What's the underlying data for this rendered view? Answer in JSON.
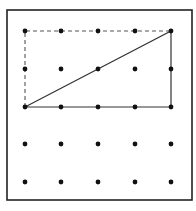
{
  "diagram": {
    "type": "geoboard",
    "grid": {
      "rows": 5,
      "cols": 5
    },
    "frame": {
      "x": 7,
      "y": 10,
      "width": 185,
      "height": 190,
      "stroke": "#222222"
    },
    "dot_x": [
      25,
      61,
      98,
      135,
      171
    ],
    "dot_y": [
      31,
      69,
      107,
      144,
      182
    ],
    "dot_color": "#111111",
    "triangle": {
      "style": "solid",
      "vertices_grid": [
        [
          0,
          2
        ],
        [
          4,
          0
        ],
        [
          4,
          2
        ]
      ],
      "stroke": "#333333"
    },
    "dashed_completion": {
      "style": "dashed",
      "path_grid": [
        [
          0,
          2
        ],
        [
          0,
          0
        ],
        [
          4,
          0
        ]
      ],
      "stroke": "#555555"
    }
  }
}
